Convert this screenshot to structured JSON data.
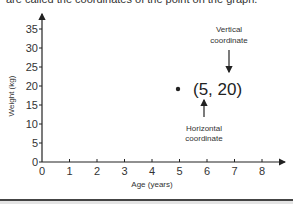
{
  "intro_text": "are called the coordinates of the point on the graph.",
  "chart_data": {
    "type": "scatter",
    "title": "",
    "xlabel": "Age (years)",
    "ylabel": "Weight (kg)",
    "xlim": [
      0,
      8
    ],
    "ylim": [
      0,
      35
    ],
    "x_ticks": [
      "0",
      "1",
      "2",
      "3",
      "4",
      "5",
      "6",
      "7",
      "8"
    ],
    "y_ticks": [
      "0",
      "5",
      "10",
      "15",
      "20",
      "25",
      "30",
      "35"
    ],
    "grid": false,
    "points": [
      {
        "x": 5,
        "y": 20,
        "label": "(5, 20)"
      }
    ],
    "annotations": [
      {
        "text_line1": "Vertical",
        "text_line2": "coordinate",
        "points_to": "20"
      },
      {
        "text_line1": "Horizontal",
        "text_line2": "coordinate",
        "points_to": "5"
      }
    ]
  },
  "colors": {
    "axis": "#222222",
    "text": "#333333",
    "background": "#ffffff"
  }
}
